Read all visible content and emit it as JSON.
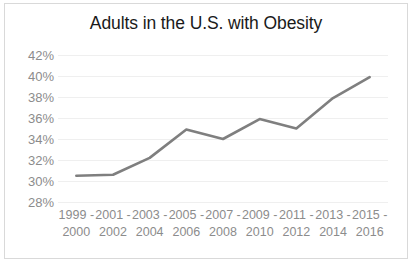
{
  "chart": {
    "title": "Adults in the U.S. with Obesity",
    "border_color": "#d9d9d9",
    "gridline_color": "#efefef",
    "axis_text_color": "#8c8c8c",
    "title_color": "#1a1a1a",
    "line_color": "#7f7f7f"
  },
  "chart_data": {
    "type": "line",
    "title": "Adults in the U.S. with Obesity",
    "xlabel": "",
    "ylabel": "",
    "categories": [
      "1999 - 2000",
      "2001 - 2002",
      "2003 - 2004",
      "2005 - 2006",
      "2007 - 2008",
      "2009 - 2010",
      "2011 - 2012",
      "2013 - 2014",
      "2015 - 2016"
    ],
    "category_lines": [
      [
        "1999 -",
        "2000"
      ],
      [
        "2001 -",
        "2002"
      ],
      [
        "2003 -",
        "2004"
      ],
      [
        "2005 -",
        "2006"
      ],
      [
        "2007 -",
        "2008"
      ],
      [
        "2009 -",
        "2010"
      ],
      [
        "2011 -",
        "2012"
      ],
      [
        "2013 -",
        "2014"
      ],
      [
        "2015 -",
        "2016"
      ]
    ],
    "values": [
      30.5,
      30.6,
      32.2,
      34.9,
      34.0,
      35.9,
      35.0,
      37.9,
      39.9
    ],
    "series": [
      {
        "name": "Adults with Obesity",
        "values": [
          30.5,
          30.6,
          32.2,
          34.9,
          34.0,
          35.9,
          35.0,
          37.9,
          39.9
        ],
        "color": "#7f7f7f"
      }
    ],
    "ylim": [
      28,
      42
    ],
    "ytick_values": [
      42,
      40,
      38,
      36,
      34,
      32,
      30,
      28
    ],
    "ytick_labels": [
      "42%",
      "40%",
      "38%",
      "36%",
      "34%",
      "32%",
      "30%",
      "28%"
    ],
    "grid": true,
    "grid_axis": "y",
    "legend": false,
    "markers": false,
    "line_width": 2.6
  }
}
